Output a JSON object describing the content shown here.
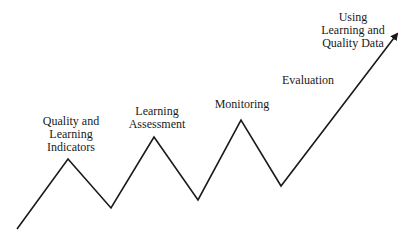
{
  "diagram": {
    "labels": [
      {
        "text": "Quality and\nLearning\nIndicators"
      },
      {
        "text": "Learning\nAssessment"
      },
      {
        "text": "Monitoring"
      },
      {
        "text": "Evaluation"
      },
      {
        "text": "Using\nLearning and\nQuality Data"
      }
    ],
    "line_color": "#1a1a1a"
  }
}
